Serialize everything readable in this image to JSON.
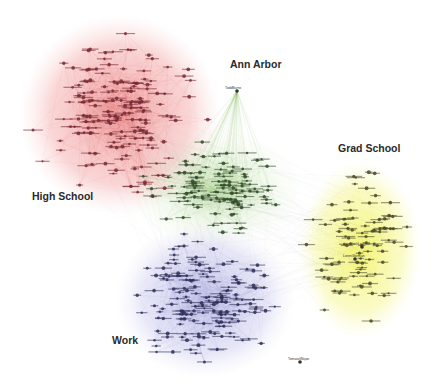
{
  "diagram": {
    "type": "social-network-graph",
    "clusters": [
      {
        "id": "high_school",
        "label": "High School",
        "color": "#e05a5a",
        "node_color": "#7a2a35",
        "label_pos": [
          32,
          198
        ],
        "center": [
          120,
          115
        ],
        "radius": [
          92,
          95
        ],
        "node_count": 170
      },
      {
        "id": "ann_arbor",
        "label": "Ann Arbor",
        "color": "#6fb04a",
        "node_color": "#2f4a2a",
        "label_pos": [
          230,
          66
        ],
        "center": [
          215,
          190
        ],
        "radius": [
          80,
          50
        ],
        "node_count": 110
      },
      {
        "id": "grad_school",
        "label": "Grad School",
        "color": "#f0f05a",
        "node_color": "#4a4a2a",
        "label_pos": [
          338,
          150
        ],
        "center": [
          360,
          250
        ],
        "radius": [
          55,
          82
        ],
        "node_count": 90
      },
      {
        "id": "work",
        "label": "Work",
        "color": "#8080d0",
        "node_color": "#2f2f5a",
        "label_pos": [
          112,
          342
        ],
        "center": [
          205,
          300
        ],
        "radius": [
          80,
          70
        ],
        "node_count": 160
      }
    ],
    "hub_nodes": [
      {
        "label": "ToddBurns",
        "x": 237,
        "y": 91,
        "cluster": "ann_arbor"
      },
      {
        "label": "NoahLesman",
        "x": 362,
        "y": 247,
        "cluster": "grad_school"
      },
      {
        "label": "LorenGlorman",
        "x": 355,
        "y": 259,
        "cluster": "grad_school"
      },
      {
        "label": "TomaszWojan",
        "x": 300,
        "y": 362,
        "cluster": "work"
      }
    ]
  }
}
